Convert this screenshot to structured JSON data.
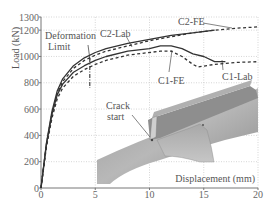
{
  "chart_data": {
    "type": "line",
    "title": "",
    "xlabel": "Displacement (mm)",
    "ylabel": "Load (kN)",
    "xlim": [
      0,
      20
    ],
    "ylim": [
      0,
      1300
    ],
    "xticks": [
      0,
      5,
      10,
      15,
      20
    ],
    "yticks": [
      0,
      200,
      400,
      600,
      800,
      1000,
      1200,
      1300
    ],
    "grid": true,
    "legend": "inline labels",
    "series": [
      {
        "name": "C2-FE",
        "style": "dashed",
        "x": [
          0,
          0.5,
          1,
          1.5,
          2,
          3,
          4,
          5,
          6,
          8,
          10,
          12,
          14,
          16,
          18,
          20
        ],
        "y": [
          0,
          330,
          560,
          720,
          810,
          910,
          970,
          1010,
          1040,
          1080,
          1120,
          1150,
          1180,
          1200,
          1215,
          1225
        ]
      },
      {
        "name": "C2-Lab",
        "style": "solid",
        "x": [
          0,
          0.5,
          1,
          1.5,
          2,
          3,
          4,
          5,
          6,
          8,
          10,
          12,
          14,
          16
        ],
        "y": [
          0,
          340,
          580,
          740,
          830,
          930,
          990,
          1030,
          1060,
          1100,
          1130,
          1160,
          1180,
          1200
        ]
      },
      {
        "name": "C1-Lab",
        "style": "solid",
        "x": [
          0,
          0.5,
          1,
          1.5,
          2,
          3,
          4,
          5,
          6,
          8,
          10,
          11,
          12,
          13,
          14,
          15,
          16,
          17
        ],
        "y": [
          0,
          330,
          560,
          710,
          790,
          880,
          930,
          970,
          1000,
          1040,
          1060,
          1080,
          1080,
          1060,
          1020,
          1000,
          960,
          960
        ]
      },
      {
        "name": "C1-FE",
        "style": "dashed",
        "x": [
          0,
          0.5,
          1,
          1.5,
          2,
          3,
          4,
          5,
          6,
          8,
          10,
          11,
          12,
          13,
          14,
          14.5,
          16,
          18,
          20
        ],
        "y": [
          0,
          310,
          530,
          680,
          760,
          850,
          900,
          940,
          970,
          1010,
          1030,
          1040,
          1040,
          1000,
          940,
          920,
          940,
          955,
          960
        ]
      }
    ],
    "annotations": [
      {
        "text": "Deformation Limit",
        "x": 4.5,
        "style": "dash-dot vertical line"
      },
      {
        "text": "C2-Lab"
      },
      {
        "text": "C2-FE"
      },
      {
        "text": "C1-FE"
      },
      {
        "text": "C1-Lab"
      },
      {
        "text": "Crack start",
        "note": "inset FE model image"
      }
    ]
  },
  "labels": {
    "ylabel": "Load (kN)",
    "xlabel": "Displacement (mm)",
    "deformation_limit_1": "Deformation",
    "deformation_limit_2": "Limit",
    "c2_lab": "C2-Lab",
    "c2_fe": "C2-FE",
    "c1_fe": "C1-FE",
    "c1_lab": "C1-Lab",
    "crack_1": "Crack",
    "crack_2": "start"
  },
  "colors": {
    "line": "#333333",
    "grid": "#bbbbbb",
    "axis": "#888888",
    "inset_dark": "#7a7a7a",
    "inset_light": "#b5b5b5"
  }
}
